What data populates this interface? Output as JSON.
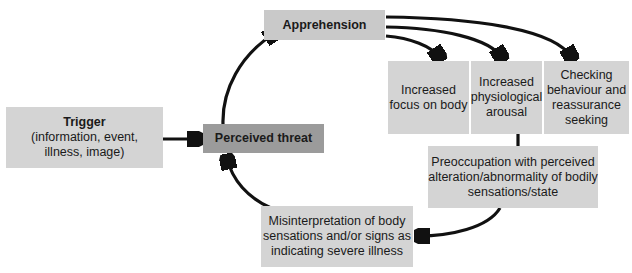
{
  "diagram": {
    "nodes": {
      "trigger": {
        "title": "Trigger",
        "subtitle_line1": "(information, event,",
        "subtitle_line2": "illness, image)"
      },
      "perceived_threat": {
        "label": "Perceived threat"
      },
      "apprehension": {
        "label": "Apprehension"
      },
      "increased_focus": {
        "line1": "Increased",
        "line2": "focus on body"
      },
      "increased_arousal": {
        "line1": "Increased",
        "line2": "physiological",
        "line3": "arousal"
      },
      "checking": {
        "line1": "Checking",
        "line2": "behaviour and",
        "line3": "reassurance",
        "line4": "seeking"
      },
      "preoccupation": {
        "line1": "Preoccupation with perceived",
        "line2": "alteration/abnormality of bodily",
        "line3": "sensations/state"
      },
      "misinterpretation": {
        "line1": "Misinterpretation of body",
        "line2": "sensations and/or signs as",
        "line3": "indicating severe illness"
      }
    },
    "edges": [
      {
        "from": "Trigger",
        "to": "Perceived threat"
      },
      {
        "from": "Perceived threat",
        "to": "Apprehension"
      },
      {
        "from": "Apprehension",
        "to": "Increased focus on body"
      },
      {
        "from": "Apprehension",
        "to": "Increased physiological arousal"
      },
      {
        "from": "Apprehension",
        "to": "Checking behaviour and reassurance seeking"
      },
      {
        "from": "Increased physiological arousal",
        "to": "Preoccupation with perceived alteration/abnormality of bodily sensations/state"
      },
      {
        "from": "Preoccupation with perceived alteration/abnormality of bodily sensations/state",
        "to": "Misinterpretation of body sensations and/or signs as indicating severe illness"
      },
      {
        "from": "Misinterpretation of body sensations and/or signs as indicating severe illness",
        "to": "Perceived threat"
      }
    ],
    "colors": {
      "light_box": "#d4d4d4",
      "apprehension_box": "#c9c9c9",
      "threat_box": "#9b9b9b",
      "arrow": "#111111"
    }
  }
}
